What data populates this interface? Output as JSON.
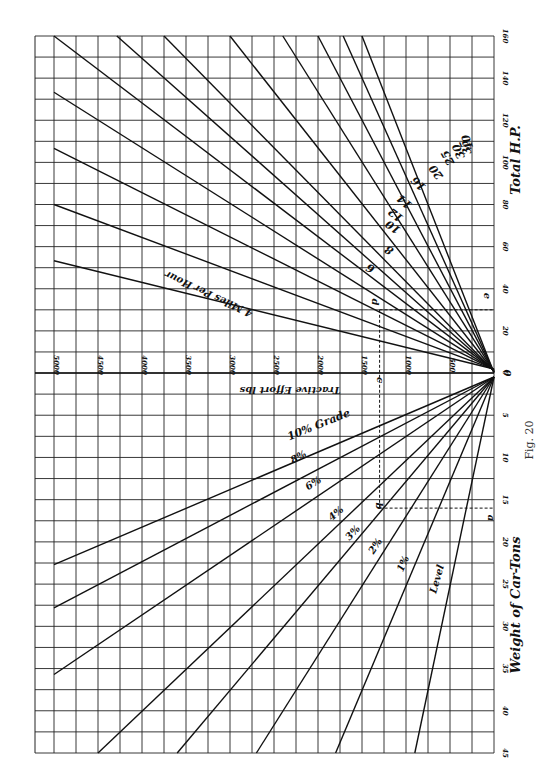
{
  "figure": {
    "caption": "Fig. 20"
  },
  "axes": {
    "top_axis_title": "Total H.P.",
    "bottom_axis_title": "Weight of Car-Tons",
    "center_axis_title": "Tractive Effort lbs",
    "hp_ticks": [
      "0",
      "20",
      "40",
      "60",
      "80",
      "100",
      "120",
      "140",
      "160"
    ],
    "tons_ticks": [
      "0",
      "5",
      "10",
      "15",
      "20",
      "25",
      "30",
      "35",
      "40",
      "45"
    ],
    "tractive_ticks": [
      "500",
      "1000",
      "1500",
      "2000",
      "2500",
      "3000",
      "3500",
      "4000",
      "4500",
      "5000"
    ]
  },
  "speed_labels": [
    "4 Miles Per Hour",
    "6",
    "8",
    "10",
    "12",
    "14",
    "16",
    "20",
    "25",
    "30",
    "35",
    "40"
  ],
  "grade_labels": [
    "10% Grade",
    "8%",
    "6%",
    "4%",
    "3%",
    "2%",
    "1%",
    "Level"
  ],
  "construction_points": [
    "a",
    "b",
    "c",
    "d",
    "e"
  ],
  "chart_data": {
    "type": "line",
    "layout": "rotated; origin at right-center; tractive effort axis horizontal (0 at right, 5000 at left); HP upward; car weight downward",
    "grid": true,
    "upper_quadrant": {
      "xlabel": "Tractive Effort lbs",
      "ylabel": "Total H.P.",
      "xlim": [
        0,
        5000
      ],
      "ylim": [
        0,
        160
      ],
      "relation": "HP = TE * mph / 375",
      "series": [
        {
          "name": "4 Miles Per Hour",
          "points": [
            [
              0,
              0
            ],
            [
              5000,
              53.3
            ]
          ]
        },
        {
          "name": "6",
          "points": [
            [
              0,
              0
            ],
            [
              5000,
              80
            ]
          ]
        },
        {
          "name": "8",
          "points": [
            [
              0,
              0
            ],
            [
              5000,
              106.7
            ]
          ]
        },
        {
          "name": "10",
          "points": [
            [
              0,
              0
            ],
            [
              5000,
              133.3
            ]
          ]
        },
        {
          "name": "12",
          "points": [
            [
              0,
              0
            ],
            [
              5000,
              160
            ]
          ]
        },
        {
          "name": "14",
          "points": [
            [
              0,
              0
            ],
            [
              4286,
              160
            ]
          ]
        },
        {
          "name": "16",
          "points": [
            [
              0,
              0
            ],
            [
              3750,
              160
            ]
          ]
        },
        {
          "name": "20",
          "points": [
            [
              0,
              0
            ],
            [
              3000,
              160
            ]
          ]
        },
        {
          "name": "25",
          "points": [
            [
              0,
              0
            ],
            [
              2400,
              160
            ]
          ]
        },
        {
          "name": "30",
          "points": [
            [
              0,
              0
            ],
            [
              2000,
              160
            ]
          ]
        },
        {
          "name": "35",
          "points": [
            [
              0,
              0
            ],
            [
              1714,
              160
            ]
          ]
        },
        {
          "name": "40",
          "points": [
            [
              0,
              0
            ],
            [
              1500,
              160
            ]
          ]
        }
      ]
    },
    "lower_quadrant": {
      "xlabel": "Tractive Effort lbs",
      "ylabel": "Weight of Car-Tons",
      "xlim": [
        0,
        5000
      ],
      "ylim": [
        0,
        45
      ],
      "relation": "TE = tons * (20 + 20 * grade%)",
      "series": [
        {
          "name": "Level",
          "lbs_per_ton": 20,
          "points": [
            [
              0,
              0
            ],
            [
              900,
              45
            ]
          ]
        },
        {
          "name": "1%",
          "lbs_per_ton": 40,
          "points": [
            [
              0,
              0
            ],
            [
              1800,
              45
            ]
          ]
        },
        {
          "name": "2%",
          "lbs_per_ton": 60,
          "points": [
            [
              0,
              0
            ],
            [
              2700,
              45
            ]
          ]
        },
        {
          "name": "3%",
          "lbs_per_ton": 80,
          "points": [
            [
              0,
              0
            ],
            [
              3600,
              45
            ]
          ]
        },
        {
          "name": "4%",
          "lbs_per_ton": 100,
          "points": [
            [
              0,
              0
            ],
            [
              4500,
              45
            ]
          ]
        },
        {
          "name": "6%",
          "lbs_per_ton": 140,
          "points": [
            [
              0,
              0
            ],
            [
              5000,
              35.7
            ]
          ]
        },
        {
          "name": "8%",
          "lbs_per_ton": 180,
          "points": [
            [
              0,
              0
            ],
            [
              5000,
              27.8
            ]
          ]
        },
        {
          "name": "10% Grade",
          "lbs_per_ton": 220,
          "points": [
            [
              0,
              0
            ],
            [
              5000,
              22.7
            ]
          ]
        }
      ]
    },
    "example_construction": {
      "a": {
        "tons": 16
      },
      "b": {
        "tons": 16,
        "grade": "4%",
        "tractive_effort": 1300
      },
      "c": {
        "tractive_effort": 1300
      },
      "d": {
        "tractive_effort": 1300,
        "speed": "8",
        "hp": 30
      },
      "e": {
        "hp": 30
      }
    }
  }
}
